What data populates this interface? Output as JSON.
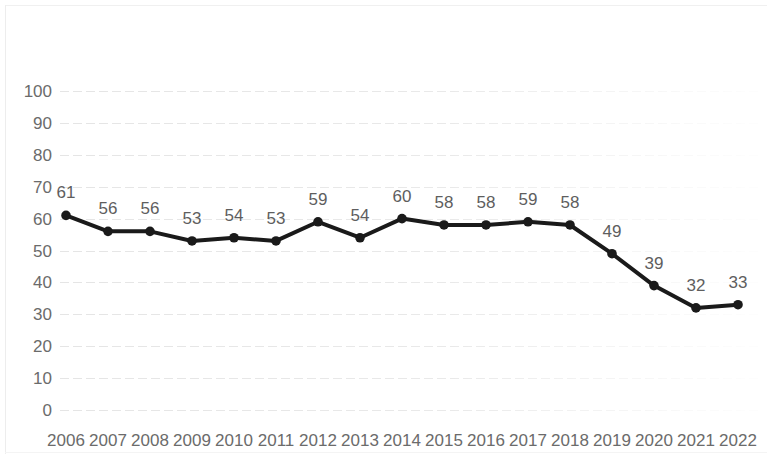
{
  "chart_data": {
    "type": "line",
    "title": "",
    "subtitle": "",
    "xlabel": "",
    "ylabel": "",
    "categories": [
      "2006",
      "2007",
      "2008",
      "2009",
      "2010",
      "2011",
      "2012",
      "2013",
      "2014",
      "2015",
      "2016",
      "2017",
      "2018",
      "2019",
      "2020",
      "2021",
      "2022"
    ],
    "values": [
      61,
      56,
      56,
      53,
      54,
      53,
      59,
      54,
      60,
      58,
      58,
      59,
      58,
      49,
      39,
      32,
      33
    ],
    "data_labels": [
      "61",
      "56",
      "56",
      "53",
      "54",
      "53",
      "59",
      "54",
      "60",
      "58",
      "58",
      "59",
      "58",
      "49",
      "39",
      "32",
      "33"
    ],
    "ylim": [
      0,
      100
    ],
    "ytick_labels": [
      "100",
      "90",
      "80",
      "70",
      "60",
      "50",
      "40",
      "30",
      "20",
      "10",
      "0"
    ],
    "ytick_values": [
      100,
      90,
      80,
      70,
      60,
      50,
      40,
      30,
      20,
      10,
      0
    ],
    "grid": true,
    "grid_axis": "y",
    "legend": false,
    "legend_position": "none",
    "series_color": "#1a1a1a",
    "marker": "circle",
    "label_color": "#5e5e5e",
    "axis_label_color": "#6b6b6b",
    "gridline_color": "#d9d9d9",
    "background_color": "#ffffff"
  }
}
